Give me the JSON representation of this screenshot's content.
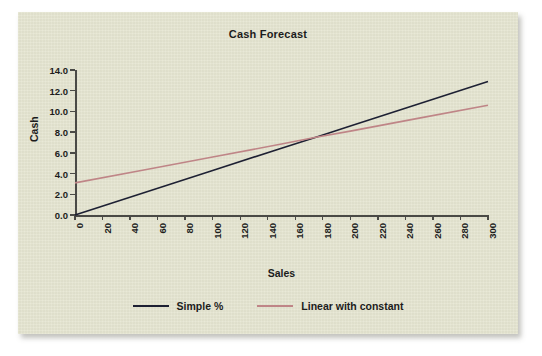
{
  "chart_data": {
    "type": "line",
    "title": "Cash Forecast",
    "xlabel": "Sales",
    "ylabel": "Cash",
    "xlim": [
      0,
      300
    ],
    "ylim": [
      0,
      14
    ],
    "grid": false,
    "legend_position": "bottom",
    "xticks": [
      "0",
      "20",
      "40",
      "60",
      "80",
      "100",
      "120",
      "140",
      "160",
      "180",
      "200",
      "220",
      "240",
      "260",
      "280",
      "300"
    ],
    "yticks": [
      "0.0",
      "2.0",
      "4.0",
      "6.0",
      "8.0",
      "10.0",
      "12.0",
      "14.0"
    ],
    "x": [
      0,
      300
    ],
    "series": [
      {
        "name": "Simple %",
        "color": "#1d2033",
        "values": [
          0.0,
          12.9
        ],
        "points": [
          {
            "x": 0,
            "y": 0.0
          },
          {
            "x": 50,
            "y": 2.15
          },
          {
            "x": 100,
            "y": 4.3
          },
          {
            "x": 150,
            "y": 6.45
          },
          {
            "x": 175,
            "y": 7.5
          },
          {
            "x": 200,
            "y": 8.6
          },
          {
            "x": 250,
            "y": 10.75
          },
          {
            "x": 300,
            "y": 12.9
          }
        ]
      },
      {
        "name": "Linear with constant",
        "color": "#bf8587",
        "values": [
          3.1,
          10.6
        ],
        "points": [
          {
            "x": 0,
            "y": 3.1
          },
          {
            "x": 50,
            "y": 4.35
          },
          {
            "x": 100,
            "y": 5.6
          },
          {
            "x": 150,
            "y": 6.85
          },
          {
            "x": 175,
            "y": 7.5
          },
          {
            "x": 200,
            "y": 8.1
          },
          {
            "x": 250,
            "y": 9.35
          },
          {
            "x": 300,
            "y": 10.6
          }
        ]
      }
    ],
    "annotations": []
  },
  "legend": {
    "items": [
      {
        "label": "Simple %",
        "color": "#1d2033"
      },
      {
        "label": "Linear with constant",
        "color": "#bf8587"
      }
    ]
  },
  "colors": {
    "panel_background": "#e4e4cf",
    "axis": "#4a4a46",
    "text": "#1c1c1c",
    "series_1": "#1d2033",
    "series_2": "#bf8587"
  }
}
